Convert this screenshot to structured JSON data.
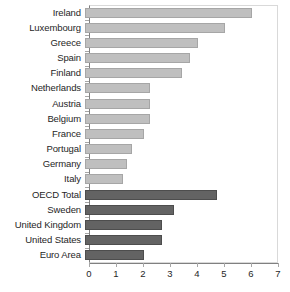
{
  "chart_data": {
    "type": "bar",
    "orientation": "horizontal",
    "title": "",
    "subtitle": "",
    "xlabel": "",
    "ylabel": "",
    "xlim": [
      0,
      7
    ],
    "xticks": [
      0,
      1,
      2,
      3,
      4,
      5,
      6,
      7
    ],
    "xtick_labels": [
      "0",
      "1",
      "2",
      "3",
      "4",
      "5",
      "6",
      "7"
    ],
    "grid": false,
    "legend": [],
    "categories": [
      "Ireland",
      "Luxembourg",
      "Greece",
      "Spain",
      "Finland",
      "Netherlands",
      "Austria",
      "Belgium",
      "France",
      "Portugal",
      "Germany",
      "Italy",
      "OECD Total",
      "Sweden",
      "United Kingdom",
      "United States",
      "Euro Area"
    ],
    "values": [
      6.2,
      5.2,
      4.2,
      3.9,
      3.6,
      2.4,
      2.4,
      2.4,
      2.2,
      1.75,
      1.55,
      1.4,
      4.9,
      3.3,
      2.85,
      2.85,
      2.2
    ],
    "bar_styles": [
      "light",
      "light",
      "light",
      "light",
      "light",
      "light",
      "light",
      "light",
      "light",
      "light",
      "light",
      "light",
      "dark",
      "dark",
      "dark",
      "dark",
      "dark"
    ],
    "colors": {
      "light_bar": "#bfbfbf",
      "light_bar_border": "#a6a6a6",
      "dark_bar": "#636363",
      "dark_bar_border": "#4d4d4d",
      "axis": "#808080",
      "plot_border": "#d9d9d9",
      "text": "#262626",
      "background": "#ffffff"
    }
  }
}
